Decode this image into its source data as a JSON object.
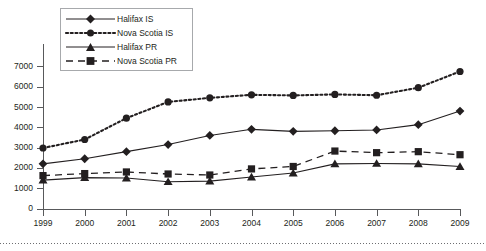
{
  "chart_data": {
    "type": "line",
    "title": "",
    "xlabel": "",
    "ylabel": "",
    "x": [
      "1999",
      "2000",
      "2001",
      "2002",
      "2003",
      "2004",
      "2005",
      "2006",
      "2007",
      "2008",
      "2009"
    ],
    "categories": [
      "1999",
      "2000",
      "2001",
      "2002",
      "2003",
      "2004",
      "2005",
      "2006",
      "2007",
      "2008",
      "2009"
    ],
    "ylim": [
      0,
      7000
    ],
    "ytick_labels": [
      "0",
      "1000",
      "2000",
      "3000",
      "4000",
      "5000",
      "6000",
      "7000"
    ],
    "yticks": [
      0,
      1000,
      2000,
      3000,
      4000,
      5000,
      6000,
      7000
    ],
    "grid": false,
    "legend_position": "top-left-inside",
    "series": [
      {
        "name": "Halifax IS",
        "marker": "diamond",
        "linestyle": "solid",
        "color": "#231f20",
        "values": [
          2200,
          2450,
          2800,
          3150,
          3600,
          3900,
          3800,
          3830,
          3870,
          4130,
          4800
        ]
      },
      {
        "name": "Nova Scotia IS",
        "marker": "circle",
        "linestyle": "dotted",
        "color": "#231f20",
        "values": [
          2980,
          3400,
          4450,
          5250,
          5450,
          5600,
          5570,
          5620,
          5580,
          5950,
          6750
        ]
      },
      {
        "name": "Halifax PR",
        "marker": "triangle",
        "linestyle": "solid",
        "color": "#231f20",
        "values": [
          1400,
          1520,
          1500,
          1320,
          1350,
          1550,
          1750,
          2200,
          2220,
          2200,
          2070
        ]
      },
      {
        "name": "Nova Scotia PR",
        "marker": "square",
        "linestyle": "dashed",
        "color": "#231f20",
        "values": [
          1620,
          1720,
          1800,
          1700,
          1650,
          1950,
          2070,
          2830,
          2750,
          2800,
          2650
        ]
      }
    ]
  },
  "legend": {
    "entries": [
      {
        "label": "Halifax IS"
      },
      {
        "label": "Nova Scotia IS"
      },
      {
        "label": "Halifax PR"
      },
      {
        "label": "Nova Scotia PR"
      }
    ]
  },
  "axes": {
    "y_labels": [
      "7000",
      "6000",
      "5000",
      "4000",
      "3000",
      "2000",
      "1000",
      "0"
    ],
    "x_labels": [
      "1999",
      "2000",
      "2001",
      "2002",
      "2003",
      "2004",
      "2005",
      "2006",
      "2007",
      "2008",
      "2009"
    ]
  },
  "colors": {
    "ink": "#231f20",
    "axis": "#58595b",
    "legend_border": "#a7a9ac",
    "rule": "#6d6e71"
  }
}
